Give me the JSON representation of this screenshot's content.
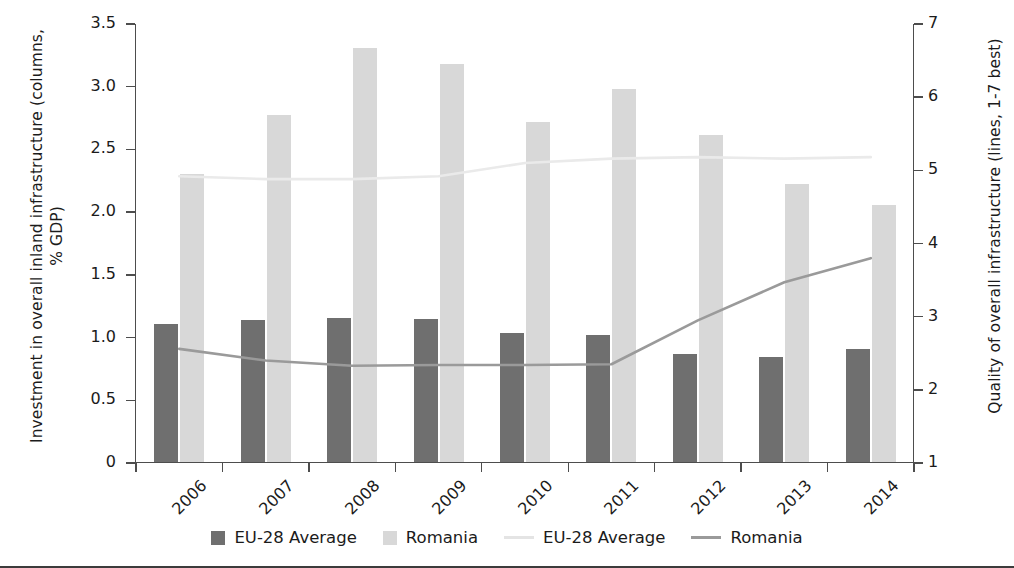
{
  "chart_data": {
    "type": "bar",
    "title": "",
    "categories": [
      "2006",
      "2007",
      "2008",
      "2009",
      "2010",
      "2011",
      "2012",
      "2013",
      "2014"
    ],
    "xlabel": "",
    "ylabel": "Investment in overall inland infrastructure (columns, % GDP)",
    "y2label": "Quality of overall infrastructure (lines, 1-7 best)",
    "ylim": [
      0,
      3.5
    ],
    "y2lim": [
      1,
      7
    ],
    "yticks": [
      "0",
      "0.5",
      "1.0",
      "1.5",
      "2.0",
      "2.5",
      "3.0",
      "3.5"
    ],
    "ytick_values": [
      0,
      0.5,
      1.0,
      1.5,
      2.0,
      2.5,
      3.0,
      3.5
    ],
    "y2ticks": [
      "1",
      "2",
      "3",
      "4",
      "5",
      "6",
      "7"
    ],
    "y2tick_values": [
      1,
      2,
      3,
      4,
      5,
      6,
      7
    ],
    "grid": false,
    "legend_position": "bottom",
    "series": [
      {
        "name": "EU-28 Average",
        "kind": "bar",
        "axis": "left",
        "color": "#6f6f6f",
        "values": [
          1.1,
          1.13,
          1.15,
          1.14,
          1.03,
          1.01,
          0.86,
          0.84,
          0.9
        ]
      },
      {
        "name": "Romania",
        "kind": "bar",
        "axis": "left",
        "color": "#d8d8d8",
        "values": [
          2.3,
          2.77,
          3.3,
          3.17,
          2.71,
          2.97,
          2.61,
          2.22,
          2.05
        ]
      },
      {
        "name": "EU-28 Average",
        "kind": "line",
        "axis": "right",
        "color": "#eaeaea",
        "values": [
          4.92,
          4.88,
          4.88,
          4.92,
          5.1,
          5.16,
          5.18,
          5.16,
          5.18
        ]
      },
      {
        "name": "Romania",
        "kind": "line",
        "axis": "right",
        "color": "#9a9a9a",
        "values": [
          2.56,
          2.4,
          2.33,
          2.34,
          2.34,
          2.35,
          2.95,
          3.47,
          3.8
        ]
      }
    ]
  },
  "legend": {
    "items": [
      {
        "label": "EU-28 Average",
        "marker": "box",
        "color": "#6f6f6f"
      },
      {
        "label": "Romania",
        "marker": "box",
        "color": "#d8d8d8"
      },
      {
        "label": "EU-28 Average",
        "marker": "line",
        "color": "#e4e4e4"
      },
      {
        "label": "Romania",
        "marker": "line",
        "color": "#9a9a9a"
      }
    ]
  }
}
